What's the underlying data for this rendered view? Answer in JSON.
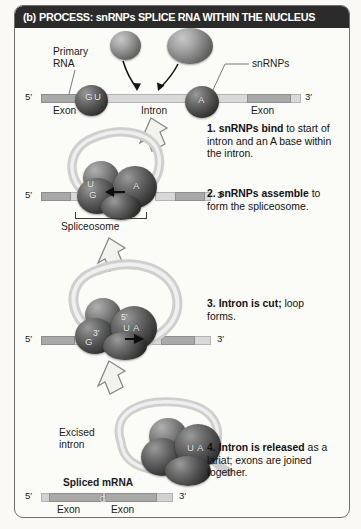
{
  "figure": {
    "panel_letter": "(b)",
    "title": "PROCESS: snRNPs SPLICE RNA WITHIN THE NUCLEUS",
    "title_bg": "#2b2b2b",
    "title_color": "#ffffff",
    "frame_border": "#6e6e6e",
    "background": "#fbfbf8"
  },
  "stage1": {
    "label_primary_rna": "Primary RNA",
    "label_primary_rna_line1": "Primary",
    "label_primary_rna_line2": "RNA",
    "label_snrnps": "snRNPs",
    "five_prime": "5′",
    "three_prime": "3′",
    "exon_left": "Exon",
    "intron": "Intron",
    "exon_right": "Exon",
    "base_g": "G",
    "base_u": "U",
    "base_a": "A"
  },
  "stage2": {
    "five_prime": "5′",
    "three_prime": "3′",
    "spliceosome": "Spliceosome",
    "base_u": "U",
    "base_g": "G",
    "base_a": "A"
  },
  "stage3": {
    "five_prime": "5′",
    "three_prime": "3′",
    "base_u": "U",
    "base_a": "A",
    "base_g": "G",
    "loop_five_prime": "5′",
    "loop_three_prime": "3′",
    "cut_five_prime": "5′"
  },
  "stage4": {
    "label_excised_intron_line1": "Excised",
    "label_excised_intron_line2": "intron",
    "label_spliced_mrna": "Spliced mRNA",
    "five_prime": "5′",
    "three_prime": "3′",
    "exon_left": "Exon",
    "exon_right": "Exon",
    "base_g": "G",
    "base_u": "U",
    "base_a": "A"
  },
  "steps": [
    {
      "id": "step-1",
      "number": "1.",
      "bold": "snRNPs bind",
      "rest": " to start of intron and an A base within the intron."
    },
    {
      "id": "step-2",
      "number": "2.",
      "bold": "snRNPs assemble",
      "rest": " to form the spliceosome."
    },
    {
      "id": "step-3",
      "number": "3.",
      "bold": "Intron is cut;",
      "rest": " loop forms."
    },
    {
      "id": "step-4",
      "number": "4.",
      "bold": "Intron is released",
      "rest": " as a lariat; exons are joined together."
    }
  ],
  "colors": {
    "exon_fill": "#a9a9a9",
    "intron_fill": "#d9d9d9",
    "snrnp_dark": "#2a2a2a",
    "arrow_outline": "#7a7a7a"
  }
}
